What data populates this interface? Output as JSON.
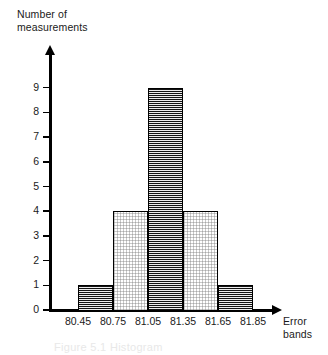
{
  "chart_data": {
    "type": "bar",
    "title": "",
    "xlabel": "Error bands",
    "ylabel": "Number of measurements",
    "ylabel_lines": [
      "Number of",
      "measurements"
    ],
    "xlabel_lines": [
      "Error",
      "bands"
    ],
    "categories": [
      "80.45-80.75",
      "80.75-81.05",
      "81.05-81.35",
      "81.35-81.65",
      "81.65-81.85"
    ],
    "values": [
      1,
      4,
      9,
      4,
      1
    ],
    "bin_edges": [
      "80.45",
      "80.75",
      "81.05",
      "81.35",
      "81.65",
      "81.85"
    ],
    "bar_fills": [
      "dark",
      "light",
      "dark",
      "light",
      "dark"
    ],
    "xticklabels": [
      "80.45",
      "80.75",
      "81.05",
      "81.35",
      "81.65",
      "81.85"
    ],
    "yticklabels": [
      "0",
      "1",
      "2",
      "3",
      "4",
      "5",
      "6",
      "7",
      "8",
      "9"
    ],
    "yticks": [
      0,
      1,
      2,
      3,
      4,
      5,
      6,
      7,
      8,
      9
    ],
    "ylim": [
      0,
      9
    ],
    "grid": false,
    "legend": null,
    "colors": {
      "dark_fill": "#141414",
      "light_fill": "#ffffff",
      "outline": "#000000",
      "axis": "#000000",
      "text": "#1a1a1a",
      "background": "#ffffff"
    }
  },
  "caption": {
    "text": "Figure 5.1  Histogram"
  }
}
